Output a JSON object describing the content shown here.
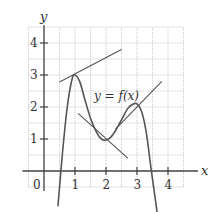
{
  "chart_data": {
    "type": "line",
    "title": "",
    "xlabel": "x",
    "ylabel": "y",
    "origin_label": "0",
    "curve_label": "y = f(x)",
    "xlim": [
      -0.5,
      4.5
    ],
    "ylim": [
      -0.5,
      4.5
    ],
    "grid": true,
    "grid_step": 0.5,
    "x_ticks": [
      1,
      2,
      3,
      4
    ],
    "x_tick_labels": [
      "1",
      "2",
      "3",
      "4"
    ],
    "y_ticks": [
      1,
      2,
      3,
      4
    ],
    "y_tick_labels": [
      "1",
      "2",
      "3",
      "4"
    ],
    "series": [
      {
        "name": "y = f(x)",
        "x": [
          0.45,
          0.6,
          0.75,
          0.9,
          1.0,
          1.15,
          1.3,
          1.5,
          1.7,
          1.85,
          2.0,
          2.15,
          2.3,
          2.5,
          2.7,
          2.85,
          3.0,
          3.15,
          3.3,
          3.45,
          3.55,
          3.65
        ],
        "y": [
          -1.1,
          0.6,
          2.0,
          2.85,
          3.0,
          2.8,
          2.3,
          1.65,
          1.2,
          1.0,
          0.97,
          1.05,
          1.25,
          1.6,
          1.95,
          2.08,
          2.1,
          1.85,
          1.2,
          0.1,
          -0.6,
          -1.3
        ]
      }
    ],
    "tangent_lines": [
      {
        "name": "tangent-at-local-max",
        "from": [
          0.5,
          2.78
        ],
        "to": [
          2.5,
          3.8
        ]
      },
      {
        "name": "tangent-near-min",
        "from": [
          1.1,
          1.8
        ],
        "to": [
          2.7,
          0.4
        ]
      },
      {
        "name": "tangent-near-second-max",
        "from": [
          2.3,
          1.3
        ],
        "to": [
          3.8,
          2.8
        ]
      }
    ],
    "colors": {
      "curve": "#555555",
      "tangent": "#555555",
      "axis": "#444444",
      "grid": "#bbbbbb"
    }
  }
}
